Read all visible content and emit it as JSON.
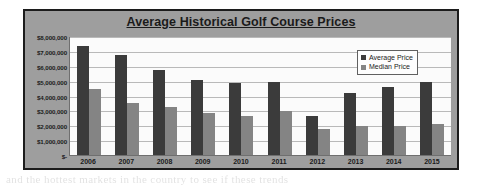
{
  "ghost_text": "and the hottest markets in the country to see if these trends",
  "legend": {
    "position": "inside-top-right",
    "entries": [
      {
        "label": "Average Price",
        "color": "#3b3b3b",
        "icon": "legend-swatch-square"
      },
      {
        "label": "Median Price",
        "color": "#848484",
        "icon": "legend-swatch-square"
      }
    ]
  },
  "colors": {
    "average_bar": "#3b3b3b",
    "median_bar": "#848484",
    "chart_background": "#9e9e9e",
    "plot_background": "#fbfbfb",
    "frame_border": "#1c1c1c",
    "gridline": "#b9b9b9"
  },
  "chart_data": {
    "type": "bar",
    "title": "Average Historical Golf Course Prices",
    "xlabel": "",
    "ylabel": "",
    "ylim": [
      0,
      8000000
    ],
    "grid": true,
    "legend_position": "inside-top-right",
    "categories": [
      "2006",
      "2007",
      "2008",
      "2009",
      "2010",
      "2011",
      "2012",
      "2013",
      "2014",
      "2015"
    ],
    "ytick_values": [
      8000000,
      7000000,
      6000000,
      5000000,
      4000000,
      3000000,
      2000000,
      1000000,
      0
    ],
    "ytick_labels": [
      "$8,000,000",
      "$7,000,000",
      "$6,000,000",
      "$5,000,000",
      "$4,000,000",
      "$3,000,000",
      "$2,000,000",
      "$1,000,000",
      "$-"
    ],
    "series": [
      {
        "name": "Average Price",
        "color": "#3b3b3b",
        "values": [
          7300000,
          6750000,
          5700000,
          5050000,
          4850000,
          4900000,
          2600000,
          4150000,
          4550000,
          4900000
        ]
      },
      {
        "name": "Median Price",
        "color": "#848484",
        "values": [
          4450000,
          3500000,
          3250000,
          2850000,
          2600000,
          2950000,
          1750000,
          1950000,
          1950000,
          2100000
        ]
      }
    ]
  }
}
